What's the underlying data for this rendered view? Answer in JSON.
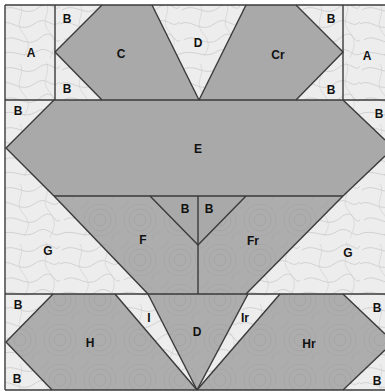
{
  "diagram": {
    "type": "quilt-block-piecing-diagram",
    "colors": {
      "light_fabric": "#ededed",
      "light_pattern": "#bdbdbd",
      "dark_fabric": "#acacac",
      "dark_pattern": "#9c9c9c",
      "solid_fabric": "#a9a9a9",
      "seam_line": "#3a3a3a"
    },
    "rows": [
      {
        "name": "top-row",
        "pieces": [
          {
            "id": "A-left",
            "label": "A",
            "fabric": "light"
          },
          {
            "id": "B-top-left-upper",
            "label": "B",
            "fabric": "light"
          },
          {
            "id": "B-top-left-lower",
            "label": "B",
            "fabric": "light"
          },
          {
            "id": "C",
            "label": "C",
            "fabric": "solid"
          },
          {
            "id": "D-top",
            "label": "D",
            "fabric": "light"
          },
          {
            "id": "Cr",
            "label": "Cr",
            "fabric": "solid"
          },
          {
            "id": "B-top-right-upper",
            "label": "B",
            "fabric": "light"
          },
          {
            "id": "B-top-right-lower",
            "label": "B",
            "fabric": "light"
          },
          {
            "id": "A-right",
            "label": "A",
            "fabric": "light"
          }
        ]
      },
      {
        "name": "middle-row",
        "pieces": [
          {
            "id": "B-mid-left",
            "label": "B",
            "fabric": "light"
          },
          {
            "id": "E",
            "label": "E",
            "fabric": "solid"
          },
          {
            "id": "B-mid-right",
            "label": "B",
            "fabric": "light"
          }
        ]
      },
      {
        "name": "lower-middle-row",
        "pieces": [
          {
            "id": "G-left",
            "label": "G",
            "fabric": "light"
          },
          {
            "id": "F",
            "label": "F",
            "fabric": "dark"
          },
          {
            "id": "B-center-left",
            "label": "B",
            "fabric": "solid"
          },
          {
            "id": "B-center-right",
            "label": "B",
            "fabric": "solid"
          },
          {
            "id": "Fr",
            "label": "Fr",
            "fabric": "dark"
          },
          {
            "id": "G-right",
            "label": "G",
            "fabric": "light"
          }
        ]
      },
      {
        "name": "bottom-row",
        "pieces": [
          {
            "id": "B-bottom-left-upper",
            "label": "B",
            "fabric": "light"
          },
          {
            "id": "B-bottom-left-lower",
            "label": "B",
            "fabric": "light"
          },
          {
            "id": "H",
            "label": "H",
            "fabric": "dark"
          },
          {
            "id": "I",
            "label": "I",
            "fabric": "light"
          },
          {
            "id": "D-bottom",
            "label": "D",
            "fabric": "dark"
          },
          {
            "id": "Ir",
            "label": "Ir",
            "fabric": "light"
          },
          {
            "id": "Hr",
            "label": "Hr",
            "fabric": "dark"
          },
          {
            "id": "B-bottom-right-upper",
            "label": "B",
            "fabric": "light"
          },
          {
            "id": "B-bottom-right-lower",
            "label": "B",
            "fabric": "light"
          }
        ]
      }
    ],
    "labels": {
      "A_left": "A",
      "B_tl_upper": "B",
      "B_tl_lower": "B",
      "C": "C",
      "D_top": "D",
      "Cr": "Cr",
      "B_tr_upper": "B",
      "B_tr_lower": "B",
      "A_right": "A",
      "B_mid_left": "B",
      "E": "E",
      "B_mid_right": "B",
      "G_left": "G",
      "F": "F",
      "B_center_left": "B",
      "B_center_right": "B",
      "Fr": "Fr",
      "G_right": "G",
      "B_bl_upper": "B",
      "B_bl_lower": "B",
      "H": "H",
      "I": "I",
      "D_bottom": "D",
      "Ir": "Ir",
      "Hr": "Hr",
      "B_br_upper": "B",
      "B_br_lower": "B"
    }
  }
}
